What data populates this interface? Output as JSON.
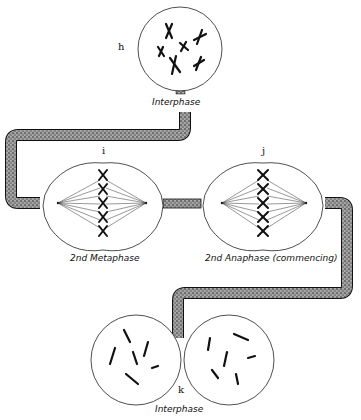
{
  "diagram": {
    "type": "cell-division-sequence",
    "stages": [
      {
        "id": "h",
        "letter": "h",
        "label": "Interphase"
      },
      {
        "id": "i",
        "letter": "i",
        "label": "2nd Metaphase"
      },
      {
        "id": "j",
        "letter": "j",
        "label": "2nd Anaphase (commencing)"
      },
      {
        "id": "k",
        "letter": "k",
        "label": "Interphase"
      }
    ],
    "connectors": [
      {
        "from": "h",
        "to": "i",
        "style": "stippled-pipe"
      },
      {
        "from": "i",
        "to": "j",
        "style": "stippled-pipe"
      },
      {
        "from": "j",
        "to": "k",
        "style": "stippled-pipe"
      }
    ]
  }
}
